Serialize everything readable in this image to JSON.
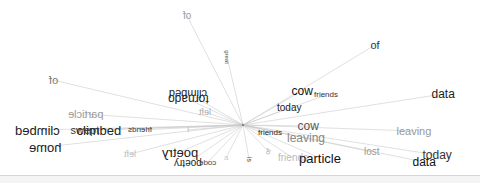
{
  "diagram": {
    "type": "radial-word-association",
    "hub": {
      "x": 243,
      "y": 125
    },
    "edge_color": "#c8c8c8",
    "words": [
      {
        "id": "w1",
        "text": "of",
        "x": 187,
        "y": 16,
        "size": 10,
        "color": "#9a9a9a",
        "transform": "scaleX(-1)"
      },
      {
        "id": "w2",
        "text": "great",
        "x": 227,
        "y": 57,
        "size": 6,
        "color": "#555555",
        "transform": "rotate(90deg)"
      },
      {
        "id": "w3",
        "text": "of",
        "x": 375,
        "y": 45,
        "size": 11,
        "color": "#333333",
        "transform": "none"
      },
      {
        "id": "w4",
        "text": "of",
        "x": 53,
        "y": 80,
        "size": 11,
        "color": "#777777",
        "transform": "scaleX(-1)"
      },
      {
        "id": "w5",
        "text": "climbed",
        "x": 188,
        "y": 93,
        "size": 11,
        "color": "#222222",
        "transform": "scale(-1,-1)"
      },
      {
        "id": "w6",
        "text": "tornado",
        "x": 188,
        "y": 99,
        "size": 12,
        "color": "#222222",
        "transform": "scale(-1,-1)"
      },
      {
        "id": "w7",
        "text": "cow",
        "x": 302,
        "y": 91,
        "size": 12,
        "color": "#111111",
        "transform": "none"
      },
      {
        "id": "w8",
        "text": "friends",
        "x": 326,
        "y": 95,
        "size": 8,
        "color": "#333333",
        "transform": "none"
      },
      {
        "id": "w9",
        "text": "data",
        "x": 443,
        "y": 94,
        "size": 12,
        "color": "#222222",
        "transform": "none"
      },
      {
        "id": "w10",
        "text": "particle",
        "x": 85,
        "y": 114,
        "size": 11,
        "color": "#999999",
        "transform": "scaleX(-1)"
      },
      {
        "id": "w11",
        "text": "left",
        "x": 205,
        "y": 112,
        "size": 9,
        "color": "#aaaaaa",
        "transform": "scaleX(-1)"
      },
      {
        "id": "w12",
        "text": "today",
        "x": 289,
        "y": 108,
        "size": 10,
        "color": "#222222",
        "transform": "none"
      },
      {
        "id": "w13",
        "text": "climbed",
        "x": 37,
        "y": 130,
        "size": 13,
        "color": "#222222",
        "transform": "scaleX(-1)"
      },
      {
        "id": "w14",
        "text": "climbed",
        "x": 99,
        "y": 130,
        "size": 13,
        "color": "#222222",
        "transform": "none"
      },
      {
        "id": "w15",
        "text": "swept",
        "x": 85,
        "y": 130,
        "size": 11,
        "color": "#333333",
        "transform": "none"
      },
      {
        "id": "w16",
        "text": "friends",
        "x": 140,
        "y": 130,
        "size": 8,
        "color": "#333333",
        "transform": "scaleX(-1)"
      },
      {
        "id": "w17",
        "text": "I",
        "x": 188,
        "y": 130,
        "size": 8,
        "color": "#bbbbbb",
        "transform": "none"
      },
      {
        "id": "w18",
        "text": "cow",
        "x": 308,
        "y": 126,
        "size": 12,
        "color": "#555555",
        "transform": "none"
      },
      {
        "id": "w19",
        "text": "friends",
        "x": 270,
        "y": 133,
        "size": 8,
        "color": "#222222",
        "transform": "none"
      },
      {
        "id": "w20",
        "text": "leaving",
        "x": 306,
        "y": 138,
        "size": 12,
        "color": "#888888",
        "transform": "none"
      },
      {
        "id": "w21",
        "text": "leaving",
        "x": 414,
        "y": 131,
        "size": 11,
        "color": "#999999",
        "transform": "none"
      },
      {
        "id": "w22",
        "text": "home",
        "x": 45,
        "y": 147,
        "size": 13,
        "color": "#222222",
        "transform": "scaleX(-1)"
      },
      {
        "id": "w23",
        "text": "left",
        "x": 130,
        "y": 154,
        "size": 9,
        "color": "#bbbbbb",
        "transform": "scaleX(-1)"
      },
      {
        "id": "w24",
        "text": "poetry",
        "x": 180,
        "y": 152,
        "size": 13,
        "color": "#222222",
        "transform": "scaleX(-1)"
      },
      {
        "id": "w25",
        "text": "of",
        "x": 268,
        "y": 151,
        "size": 7,
        "color": "#aaaaaa",
        "transform": "rotate(-60deg)"
      },
      {
        "id": "w26",
        "text": "lost",
        "x": 372,
        "y": 152,
        "size": 10,
        "color": "#999999",
        "transform": "none"
      },
      {
        "id": "w27",
        "text": "today",
        "x": 437,
        "y": 155,
        "size": 12,
        "color": "#333333",
        "transform": "none"
      },
      {
        "id": "w28",
        "text": "poetry",
        "x": 188,
        "y": 163,
        "size": 10,
        "color": "#222222",
        "transform": "scale(-1,-1)"
      },
      {
        "id": "w29",
        "text": "code",
        "x": 207,
        "y": 163,
        "size": 8,
        "color": "#444444",
        "transform": "scaleX(-1)"
      },
      {
        "id": "w30",
        "text": "a",
        "x": 226,
        "y": 158,
        "size": 8,
        "color": "#cccccc",
        "transform": "none"
      },
      {
        "id": "w31",
        "text": "is",
        "x": 249,
        "y": 159,
        "size": 7,
        "color": "#444444",
        "transform": "rotate(90deg)"
      },
      {
        "id": "w32",
        "text": "friends",
        "x": 293,
        "y": 158,
        "size": 10,
        "color": "#bbbbbb",
        "transform": "none"
      },
      {
        "id": "w33",
        "text": "particle",
        "x": 320,
        "y": 158,
        "size": 13,
        "color": "#111111",
        "transform": "none"
      },
      {
        "id": "w34",
        "text": "data",
        "x": 424,
        "y": 162,
        "size": 12,
        "color": "#111111",
        "transform": "none"
      }
    ]
  }
}
